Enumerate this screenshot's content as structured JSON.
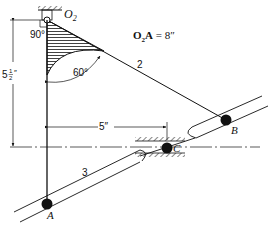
{
  "diagram": {
    "labels": {
      "pivot": "O",
      "pivot_sub": "2",
      "equation_bold": "O",
      "equation_sub": "2",
      "equation_bold2": "A",
      "equation_rest": " = 8″",
      "angle_right": "90°",
      "angle_60": "60°",
      "link2": "2",
      "link3": "3",
      "point_a": "A",
      "point_b": "B",
      "point_c": "C",
      "dim_vertical_whole": "5",
      "dim_vertical_num": "1",
      "dim_vertical_den": "2",
      "dim_vertical_unit": "″",
      "dim_horizontal": "5″"
    },
    "dimensions": {
      "O2A": "8 in",
      "vertical_offset": "5 1/2 in",
      "horizontal_offset": "5 in",
      "angle_at_O2": "90°",
      "angle_link2": "60°"
    },
    "colors": {
      "ink": "#111111",
      "background": "#ffffff"
    }
  }
}
